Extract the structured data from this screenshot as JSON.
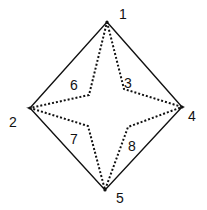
{
  "diagram": {
    "title": "",
    "vertex_labels": [
      "1",
      "2",
      "4",
      "5"
    ],
    "inner_labels": [
      "6",
      "3",
      "7",
      "8"
    ],
    "labels": {
      "n1": "1",
      "n2": "2",
      "n3": "3",
      "n4": "4",
      "n5": "5",
      "n6": "6",
      "n7": "7",
      "n8": "8"
    },
    "vertices": {
      "top": [
        107,
        22
      ],
      "left": [
        30,
        108
      ],
      "right": [
        182,
        107
      ],
      "bottom": [
        105,
        190
      ]
    },
    "inner_points": {
      "upper_left": [
        89,
        95
      ],
      "upper_right": [
        124,
        89
      ],
      "lower_left": [
        88,
        126
      ],
      "lower_right": [
        128,
        127
      ]
    },
    "outer_shape": "solid diamond",
    "inner_shape": "dotted four-pointed star"
  }
}
